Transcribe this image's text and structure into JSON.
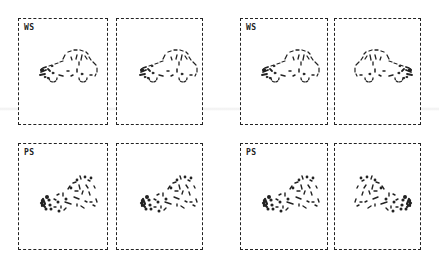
{
  "figure": {
    "groups": [
      {
        "position": "left",
        "rows": [
          {
            "label": "WS",
            "panels": [
              {
                "stimulus": "car-dotted-outline",
                "orientation": "left-facing"
              },
              {
                "stimulus": "car-dotted-outline",
                "orientation": "left-facing"
              }
            ]
          },
          {
            "label": "PS",
            "panels": [
              {
                "stimulus": "car-scrambled-fragments",
                "orientation": "left-facing"
              },
              {
                "stimulus": "car-scrambled-fragments",
                "orientation": "left-facing"
              }
            ]
          }
        ]
      },
      {
        "position": "right",
        "rows": [
          {
            "label": "WS",
            "panels": [
              {
                "stimulus": "car-dotted-outline",
                "orientation": "left-facing"
              },
              {
                "stimulus": "car-dotted-outline",
                "orientation": "right-facing"
              }
            ]
          },
          {
            "label": "PS",
            "panels": [
              {
                "stimulus": "car-scrambled-fragments",
                "orientation": "left-facing"
              },
              {
                "stimulus": "car-scrambled-fragments",
                "orientation": "right-facing"
              }
            ]
          }
        ]
      }
    ],
    "labels": {
      "ws": "WS",
      "ps": "PS"
    },
    "colors": {
      "ink": "#222222",
      "background": "#ffffff"
    }
  }
}
